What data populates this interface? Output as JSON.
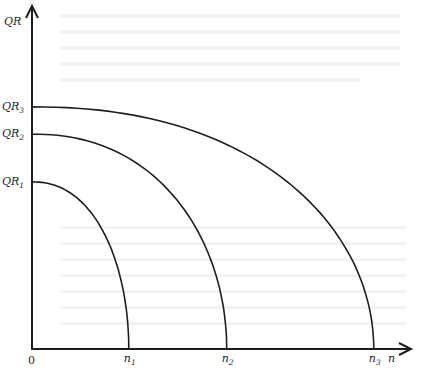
{
  "diagram": {
    "y_axis_label": "QR",
    "x_axis_label": "n",
    "origin_label": "0",
    "curves": [
      {
        "name": "curve-1",
        "y_label": "QR",
        "y_sub": "1",
        "x_label": "n",
        "x_sub": "1",
        "y_intercept": 0.49,
        "x_intercept": 0.254
      },
      {
        "name": "curve-2",
        "y_label": "QR",
        "y_sub": "2",
        "x_label": "n",
        "x_sub": "2",
        "y_intercept": 0.63,
        "x_intercept": 0.511
      },
      {
        "name": "curve-3",
        "y_label": "QR",
        "y_sub": "3",
        "x_label": "n",
        "x_sub": "3",
        "y_intercept": 0.71,
        "x_intercept": 0.897
      }
    ],
    "colors": {
      "ink": "#1e1e1e",
      "paper": "#ffffff"
    }
  }
}
